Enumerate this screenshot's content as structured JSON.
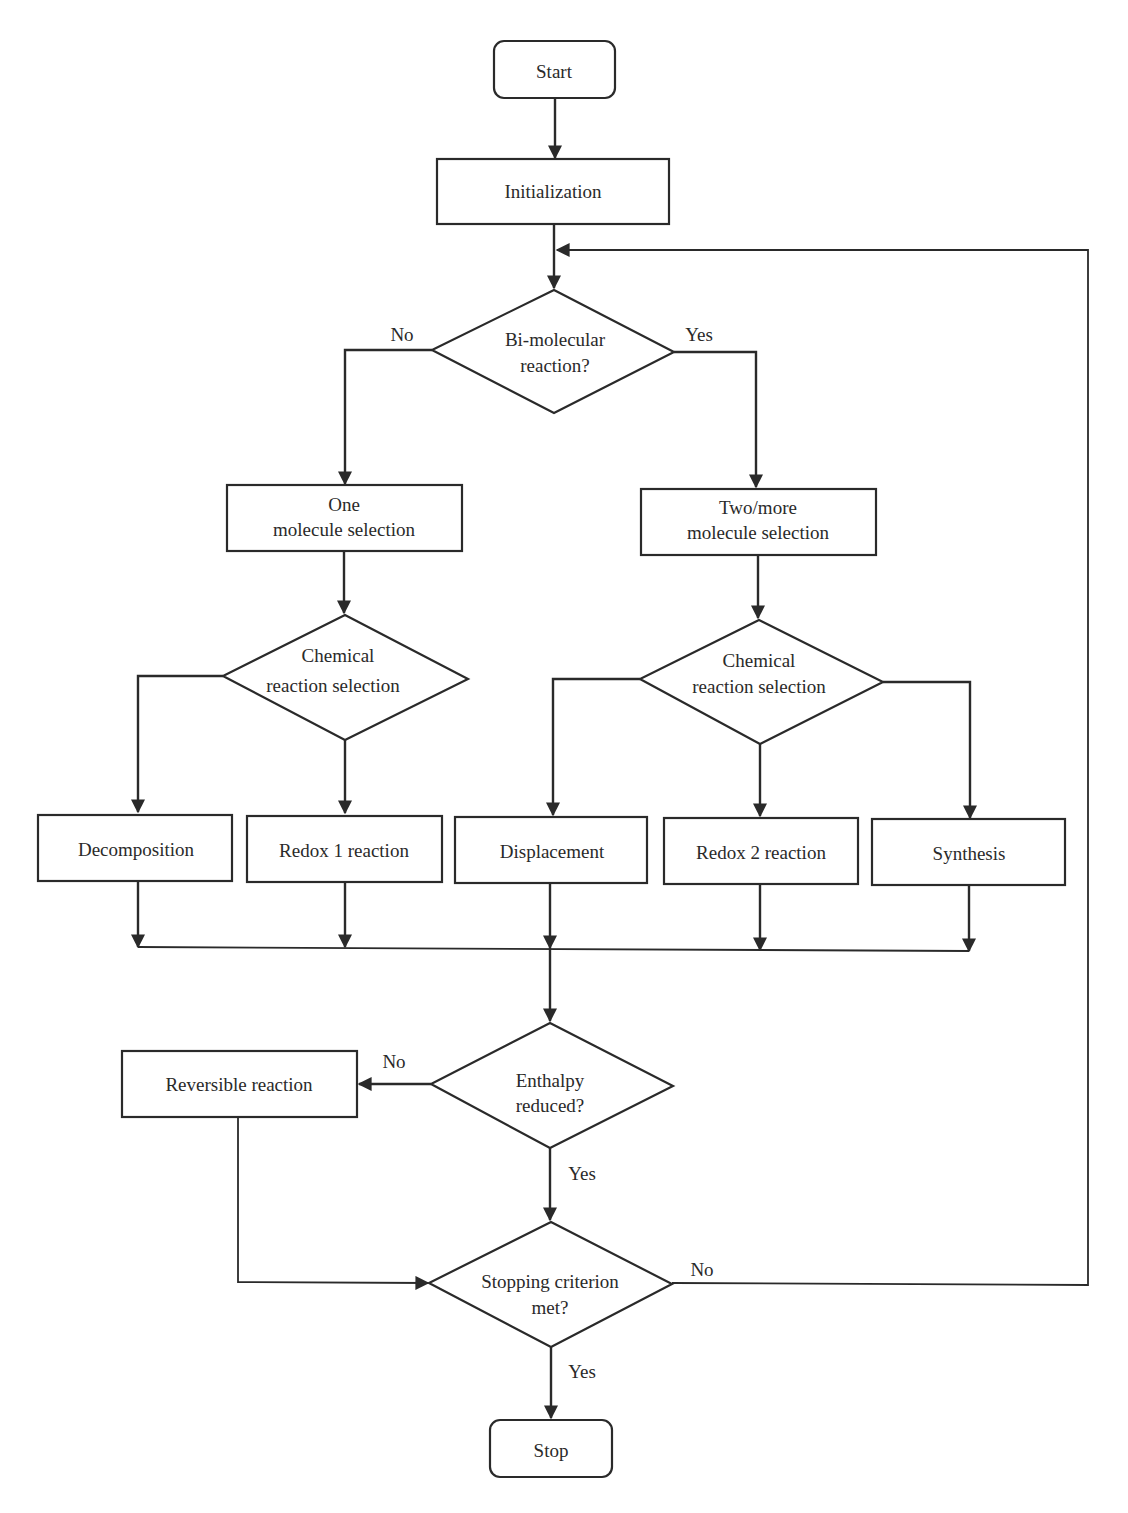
{
  "diagram": {
    "type": "flowchart",
    "colors": {
      "stroke": "#2a2a2a",
      "text": "#2a2a2a",
      "background": "#ffffff"
    },
    "nodes": {
      "start": {
        "label": "Start",
        "shape": "rounded-rect"
      },
      "initialization": {
        "label": "Initialization",
        "shape": "rect"
      },
      "bimolecular": {
        "line1": "Bi-molecular",
        "line2": "reaction?",
        "shape": "diamond"
      },
      "one_molecule": {
        "line1": "One",
        "line2": "molecule selection",
        "shape": "rect"
      },
      "two_molecule": {
        "line1": "Two/more",
        "line2": "molecule selection",
        "shape": "rect"
      },
      "chem_left": {
        "line1": "Chemical",
        "line2": "reaction selection",
        "shape": "diamond"
      },
      "chem_right": {
        "line1": "Chemical",
        "line2": "reaction selection",
        "shape": "diamond"
      },
      "decomposition": {
        "label": "Decomposition",
        "shape": "rect"
      },
      "redox1": {
        "label": "Redox 1 reaction",
        "shape": "rect"
      },
      "displacement": {
        "label": "Displacement",
        "shape": "rect"
      },
      "redox2": {
        "label": "Redox 2 reaction",
        "shape": "rect"
      },
      "synthesis": {
        "label": "Synthesis",
        "shape": "rect"
      },
      "enthalpy": {
        "line1": "Enthalpy",
        "line2": "reduced?",
        "shape": "diamond"
      },
      "reversible": {
        "label": "Reversible reaction",
        "shape": "rect"
      },
      "stopping": {
        "line1": "Stopping criterion",
        "line2": "met?",
        "shape": "diamond"
      },
      "stop": {
        "label": "Stop",
        "shape": "rounded-rect"
      }
    },
    "edge_labels": {
      "bimolecular_no": "No",
      "bimolecular_yes": "Yes",
      "enthalpy_no": "No",
      "enthalpy_yes": "Yes",
      "stopping_no": "No",
      "stopping_yes": "Yes"
    },
    "edges": [
      {
        "from": "start",
        "to": "initialization"
      },
      {
        "from": "initialization",
        "to": "bimolecular"
      },
      {
        "from": "bimolecular",
        "to": "one_molecule",
        "label": "No"
      },
      {
        "from": "bimolecular",
        "to": "two_molecule",
        "label": "Yes"
      },
      {
        "from": "one_molecule",
        "to": "chem_left"
      },
      {
        "from": "two_molecule",
        "to": "chem_right"
      },
      {
        "from": "chem_left",
        "to": "decomposition"
      },
      {
        "from": "chem_left",
        "to": "redox1"
      },
      {
        "from": "chem_right",
        "to": "displacement"
      },
      {
        "from": "chem_right",
        "to": "redox2"
      },
      {
        "from": "chem_right",
        "to": "synthesis"
      },
      {
        "from": "decomposition",
        "to": "enthalpy"
      },
      {
        "from": "redox1",
        "to": "enthalpy"
      },
      {
        "from": "displacement",
        "to": "enthalpy"
      },
      {
        "from": "redox2",
        "to": "enthalpy"
      },
      {
        "from": "synthesis",
        "to": "enthalpy"
      },
      {
        "from": "enthalpy",
        "to": "reversible",
        "label": "No"
      },
      {
        "from": "enthalpy",
        "to": "stopping",
        "label": "Yes"
      },
      {
        "from": "reversible",
        "to": "stopping"
      },
      {
        "from": "stopping",
        "to": "bimolecular",
        "label": "No"
      },
      {
        "from": "stopping",
        "to": "stop",
        "label": "Yes"
      }
    ]
  }
}
